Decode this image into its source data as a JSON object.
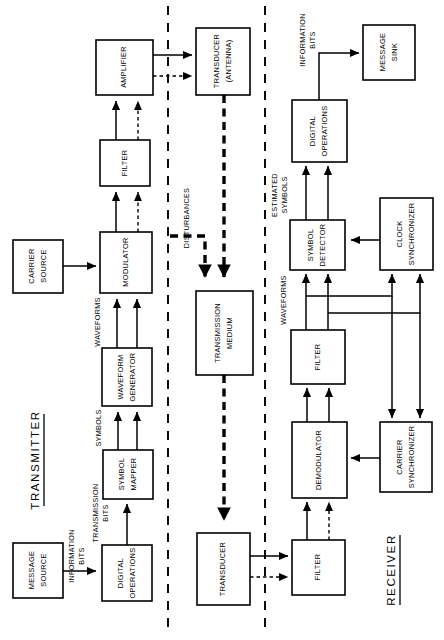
{
  "diagram": {
    "orientation": "rotated-90-ccw",
    "sections": [
      {
        "id": "transmitter",
        "label": "TRANSMITTER"
      },
      {
        "id": "receiver",
        "label": "RECEIVER"
      }
    ],
    "blocks": [
      {
        "id": "message-source",
        "lines": [
          "MESSAGE",
          "SOURCE"
        ]
      },
      {
        "id": "digital-operations-tx",
        "lines": [
          "DIGITAL",
          "OPERATIONS"
        ]
      },
      {
        "id": "symbol-mapper",
        "lines": [
          "SYMBOL",
          "MAPPER"
        ]
      },
      {
        "id": "waveform-generator",
        "lines": [
          "WAVEFORM",
          "GENERATOR"
        ]
      },
      {
        "id": "modulator",
        "lines": [
          "MODULATOR"
        ]
      },
      {
        "id": "carrier-source",
        "lines": [
          "CARRIER",
          "SOURCE"
        ]
      },
      {
        "id": "filter-tx",
        "lines": [
          "FILTER"
        ]
      },
      {
        "id": "amplifier",
        "lines": [
          "AMPLIFIER"
        ]
      },
      {
        "id": "transducer-antenna",
        "lines": [
          "TRANSDUCER",
          "(ANTENNA)"
        ]
      },
      {
        "id": "transmission-medium",
        "lines": [
          "TRANSMISSION",
          "MEDIUM"
        ]
      },
      {
        "id": "transducer-rx",
        "lines": [
          "TRANSDUCER"
        ]
      },
      {
        "id": "filter-rx-1",
        "lines": [
          "FILTER"
        ]
      },
      {
        "id": "demodulator",
        "lines": [
          "DEMODULATOR"
        ]
      },
      {
        "id": "carrier-synchronizer",
        "lines": [
          "CARRIER",
          "SYNCHRONIZER"
        ]
      },
      {
        "id": "filter-rx-2",
        "lines": [
          "FILTER"
        ]
      },
      {
        "id": "symbol-detector",
        "lines": [
          "SYMBOL",
          "DETECTOR"
        ]
      },
      {
        "id": "clock-synchronizer",
        "lines": [
          "CLOCK",
          "SYNCHRONIZER"
        ]
      },
      {
        "id": "digital-operations-rx",
        "lines": [
          "DIGITAL",
          "OPERATIONS"
        ]
      },
      {
        "id": "message-sink",
        "lines": [
          "MESSAGE",
          "SINK"
        ]
      }
    ],
    "signal_labels": [
      {
        "id": "information-bits-tx",
        "lines": [
          "INFORMATION",
          "BITS"
        ]
      },
      {
        "id": "transmission-bits",
        "lines": [
          "TRANSMISSION",
          "BITS"
        ]
      },
      {
        "id": "symbols",
        "lines": [
          "SYMBOLS"
        ]
      },
      {
        "id": "waveforms-tx",
        "lines": [
          "WAVEFORMS"
        ]
      },
      {
        "id": "disturbances",
        "lines": [
          "DISTURBANCES"
        ]
      },
      {
        "id": "waveforms-rx",
        "lines": [
          "WAVEFORMS"
        ]
      },
      {
        "id": "estimated-symbols",
        "lines": [
          "ESTIMATED",
          "SYMBOLS"
        ]
      },
      {
        "id": "information-bits-rx",
        "lines": [
          "INFORMATION",
          "BITS"
        ]
      }
    ],
    "colors": {
      "stroke": "#000000",
      "fill": "#ffffff",
      "background": "#ffffff"
    }
  }
}
